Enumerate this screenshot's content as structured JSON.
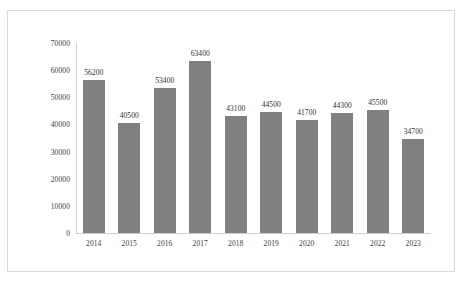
{
  "frame": {
    "background_color": "#ffffff",
    "border_color": "#d9d9d9"
  },
  "chart_data": {
    "type": "bar",
    "title": "",
    "subtitle": "",
    "xlabel": "",
    "ylabel": "",
    "categories": [
      "2014",
      "2015",
      "2016",
      "2017",
      "2018",
      "2019",
      "2020",
      "2021",
      "2022",
      "2023"
    ],
    "values": [
      56200,
      40500,
      53400,
      63400,
      43100,
      44500,
      41700,
      44300,
      45500,
      34700
    ],
    "data_labels": [
      "56200",
      "40500",
      "53400",
      "63400",
      "43100",
      "44500",
      "41700",
      "44300",
      "45500",
      "34700"
    ],
    "ylim": [
      0,
      70000
    ],
    "ytick_values": [
      0,
      10000,
      20000,
      30000,
      40000,
      50000,
      60000,
      70000
    ],
    "ytick_labels": [
      "0",
      "10000",
      "20000",
      "30000",
      "40000",
      "50000",
      "60000",
      "70000"
    ],
    "grid": false,
    "legend": null,
    "series_color": "#808080",
    "axis_color": "#cfcfcf",
    "text_color": "#3d3d3d"
  }
}
